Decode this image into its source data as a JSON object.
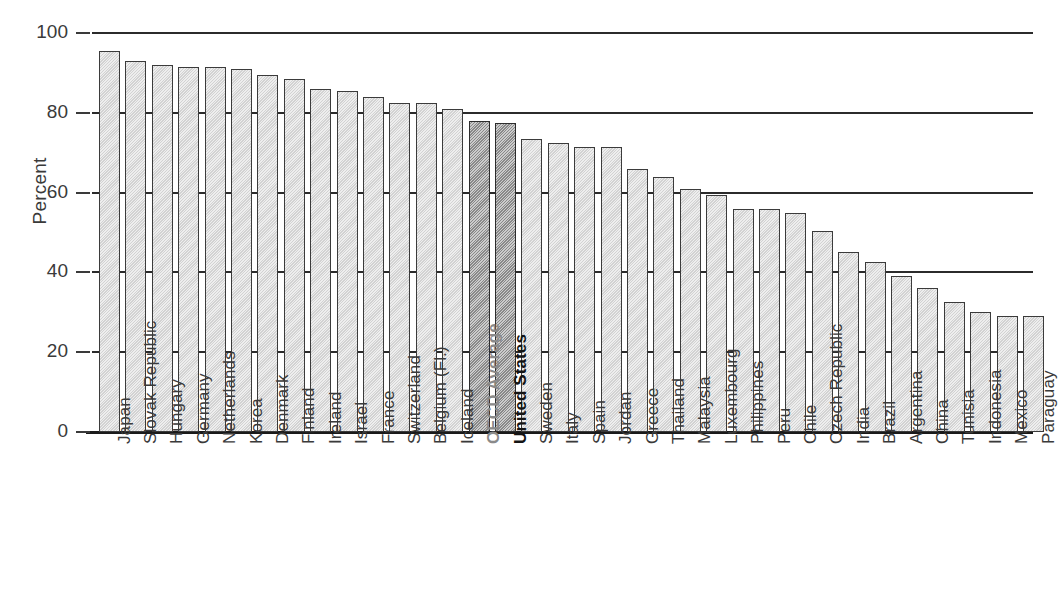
{
  "chart_data": {
    "type": "bar",
    "title": "",
    "subtitle": "",
    "xlabel": "",
    "ylabel": "Percent",
    "ylim": [
      0,
      100
    ],
    "yticks": [
      0,
      20,
      40,
      60,
      80,
      100
    ],
    "ytick_labels": [
      "0",
      "20",
      "40",
      "60",
      "80",
      "100"
    ],
    "grid": "horizontal-gridlines-only",
    "legend": "none",
    "highlight_color": "#8d8d8d",
    "bar_color": "#d9d9d9",
    "bar_edge_color": "#3b3b3b",
    "categories": [
      "Japan",
      "Slovak Republic",
      "Hungary",
      "Germany",
      "Netherlands",
      "Korea",
      "Denmark",
      "Finland",
      "Ireland",
      "Israel",
      "France",
      "Switzerland",
      "Belgium (Fl.)",
      "Iceland",
      "OECD Average",
      "United States",
      "Sweden",
      "Italy",
      "Spain",
      "Jordan",
      "Greece",
      "Thailand",
      "Malaysia",
      "Luxembourg",
      "Philippines",
      "Peru",
      "Chile",
      "Czech Republic",
      "India",
      "Brazil",
      "Argentina",
      "China",
      "Tunisia",
      "Indonesia",
      "Mexico",
      "Paraguay"
    ],
    "values": [
      95.5,
      93.0,
      92.0,
      91.5,
      91.5,
      91.0,
      89.5,
      88.5,
      86.0,
      85.5,
      84.0,
      82.5,
      82.5,
      81.0,
      78.0,
      77.5,
      73.5,
      72.5,
      71.5,
      71.5,
      66.0,
      64.0,
      61.0,
      59.5,
      56.0,
      56.0,
      55.0,
      50.5,
      45.0,
      42.5,
      39.0,
      36.0,
      32.5,
      30.0,
      29.0,
      29.0
    ],
    "highlighted": [
      "OECD Average",
      "United States"
    ],
    "highlight_label_styles": {
      "OECD Average": "bold-gray",
      "United States": "bold-black"
    }
  }
}
